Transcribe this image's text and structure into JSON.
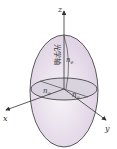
{
  "diagram": {
    "type": "index-ellipsoid",
    "axes": {
      "x": "x",
      "y": "y",
      "z": "z"
    },
    "labels": {
      "optical_axis": "光学轴",
      "ne": "n",
      "ne_sub": "e",
      "no1": "n",
      "no1_sub": "o",
      "no2": "n",
      "no2_sub": "o"
    },
    "colors": {
      "fill": "#ece4ee",
      "equator_fill": "#dcd6e2",
      "stroke": "#333333"
    }
  }
}
